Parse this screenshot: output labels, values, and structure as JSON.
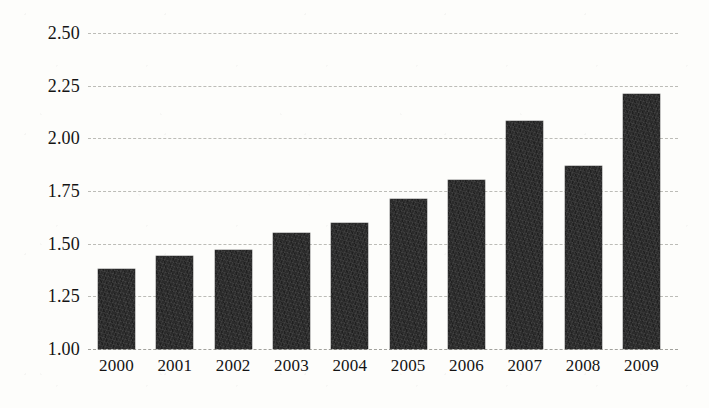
{
  "chart_data": {
    "type": "bar",
    "title": "",
    "subtitle": "",
    "xlabel": "",
    "ylabel": "",
    "categories": [
      "2000",
      "2001",
      "2002",
      "2003",
      "2004",
      "2005",
      "2006",
      "2007",
      "2008",
      "2009"
    ],
    "values": [
      1.38,
      1.44,
      1.47,
      1.55,
      1.6,
      1.71,
      1.8,
      2.08,
      1.87,
      2.21
    ],
    "series": [
      {
        "name": "",
        "values": [
          1.38,
          1.44,
          1.47,
          1.55,
          1.6,
          1.71,
          1.8,
          2.08,
          1.87,
          2.21
        ]
      }
    ],
    "ylim": [
      1.0,
      2.5
    ],
    "ytick_values": [
      2.5,
      2.25,
      2.0,
      1.75,
      1.5,
      1.25,
      1.0
    ],
    "ytick_labels": [
      "2.50",
      "2.25",
      "2.00",
      "1.75",
      "1.50",
      "1.25",
      "1.00"
    ],
    "xtick_labels": [
      "2000",
      "2001",
      "2002",
      "2003",
      "2004",
      "2005",
      "2006",
      "2007",
      "2008",
      "2009"
    ],
    "grid": true,
    "grid_style": "dashed",
    "grid_axis": "y",
    "legend": false,
    "legend_position": "none",
    "annotations": [],
    "colors": {
      "bar": "#2b2b2b",
      "gridline": "#b9b9b4",
      "background": "#fdfdfb",
      "text": "#141414"
    }
  }
}
